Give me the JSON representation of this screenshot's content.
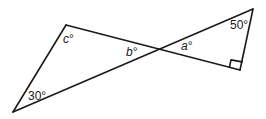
{
  "diagram": {
    "type": "geometry-crossing-triangles",
    "points": {
      "top_left": [
        66,
        25
      ],
      "bottom_left": [
        13,
        112
      ],
      "top_right": [
        253,
        9
      ],
      "bottom_right": [
        240,
        70
      ],
      "intersection": [
        160,
        50
      ]
    },
    "labels": {
      "c": "c°",
      "b": "b°",
      "a": "a°",
      "angle_bottom_left": "30°",
      "angle_top_right": "50°"
    },
    "right_angle_marker": "bottom_right",
    "colors": {
      "stroke": "#1a1a1a",
      "background": "#ffffff"
    }
  }
}
